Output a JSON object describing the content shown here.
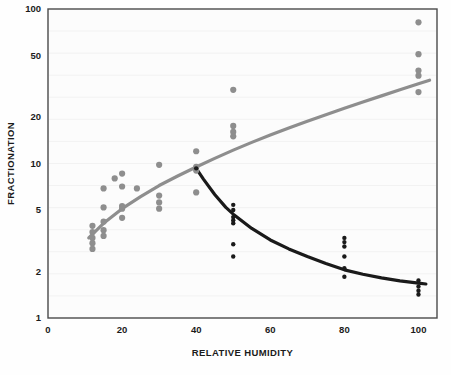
{
  "chart_data": {
    "type": "scatter",
    "title": "",
    "subtitle": "",
    "xlabel": "RELATIVE HUMIDITY",
    "ylabel": "FRACTIONATION",
    "xlim": [
      0,
      105
    ],
    "ylim": [
      1,
      100
    ],
    "yscale": "log",
    "xscale": "linear",
    "grid": false,
    "legend": "none",
    "xticks": [
      0,
      20,
      40,
      60,
      80,
      100
    ],
    "xtick_labels": [
      "0",
      "20",
      "40",
      "60",
      "80",
      "100"
    ],
    "yticks": [
      1,
      2,
      5,
      10,
      20,
      50,
      100
    ],
    "ytick_labels": [
      "1",
      "2",
      "5",
      "10",
      "20",
      "50",
      "100"
    ],
    "colors": {
      "series_gray": "#8e8e8e",
      "series_black": "#1a1a1a",
      "frame": "#4a4a4a",
      "text": "#1b1b1b",
      "background": "#fdfdfd"
    },
    "series": [
      {
        "name": "gray-series",
        "color": "#8e8e8e",
        "marker": "circle",
        "points": [
          {
            "x": 12,
            "y": 3.95
          },
          {
            "x": 12,
            "y": 3.6
          },
          {
            "x": 12,
            "y": 3.3
          },
          {
            "x": 12,
            "y": 3.05
          },
          {
            "x": 12,
            "y": 2.8
          },
          {
            "x": 15,
            "y": 6.9
          },
          {
            "x": 15,
            "y": 5.2
          },
          {
            "x": 15,
            "y": 4.2
          },
          {
            "x": 15,
            "y": 3.7
          },
          {
            "x": 15,
            "y": 3.4
          },
          {
            "x": 18,
            "y": 8.0
          },
          {
            "x": 20,
            "y": 7.1
          },
          {
            "x": 20,
            "y": 5.3
          },
          {
            "x": 20,
            "y": 5.1
          },
          {
            "x": 20,
            "y": 4.45
          },
          {
            "x": 20,
            "y": 8.6
          },
          {
            "x": 24,
            "y": 6.9
          },
          {
            "x": 30,
            "y": 9.8
          },
          {
            "x": 30,
            "y": 6.2
          },
          {
            "x": 30,
            "y": 5.6
          },
          {
            "x": 30,
            "y": 5.1
          },
          {
            "x": 40,
            "y": 12.0
          },
          {
            "x": 40,
            "y": 9.5
          },
          {
            "x": 40,
            "y": 9.0
          },
          {
            "x": 40,
            "y": 6.5
          },
          {
            "x": 50,
            "y": 30.0
          },
          {
            "x": 50,
            "y": 17.5
          },
          {
            "x": 50,
            "y": 16.0
          },
          {
            "x": 50,
            "y": 15.0
          },
          {
            "x": 100,
            "y": 82.0
          },
          {
            "x": 100,
            "y": 51.0
          },
          {
            "x": 100,
            "y": 40.0
          },
          {
            "x": 100,
            "y": 37.0
          },
          {
            "x": 100,
            "y": 29.0
          }
        ]
      },
      {
        "name": "black-series",
        "color": "#1a1a1a",
        "marker": "circle",
        "points": [
          {
            "x": 40,
            "y": 9.3
          },
          {
            "x": 50,
            "y": 5.4
          },
          {
            "x": 50,
            "y": 5.0
          },
          {
            "x": 50,
            "y": 4.5
          },
          {
            "x": 50,
            "y": 4.3
          },
          {
            "x": 50,
            "y": 4.1
          },
          {
            "x": 50,
            "y": 3.0
          },
          {
            "x": 50,
            "y": 2.5
          },
          {
            "x": 80,
            "y": 3.3
          },
          {
            "x": 80,
            "y": 3.1
          },
          {
            "x": 80,
            "y": 2.9
          },
          {
            "x": 80,
            "y": 2.5
          },
          {
            "x": 80,
            "y": 2.1
          },
          {
            "x": 80,
            "y": 1.85
          },
          {
            "x": 100,
            "y": 1.75
          },
          {
            "x": 100,
            "y": 1.6
          },
          {
            "x": 100,
            "y": 1.5
          },
          {
            "x": 100,
            "y": 1.42
          }
        ]
      }
    ],
    "fit_curves": [
      {
        "name": "gray-fit",
        "color": "#8e8e8e",
        "x": [
          11,
          15,
          20,
          25,
          30,
          35,
          40,
          45,
          50,
          55,
          60,
          65,
          70,
          75,
          80,
          85,
          90,
          95,
          100,
          103
        ],
        "y": [
          3.3,
          4.1,
          5.1,
          6.1,
          7.2,
          8.3,
          9.5,
          10.8,
          12.2,
          13.7,
          15.3,
          17.0,
          18.8,
          20.7,
          22.8,
          25.0,
          27.4,
          30.0,
          32.8,
          34.6
        ]
      },
      {
        "name": "black-fit",
        "color": "#1a1a1a",
        "x": [
          40,
          42,
          45,
          48,
          50,
          55,
          60,
          65,
          70,
          75,
          80,
          85,
          90,
          95,
          100,
          102
        ],
        "y": [
          9.3,
          7.9,
          6.3,
          5.2,
          4.7,
          3.8,
          3.2,
          2.8,
          2.5,
          2.25,
          2.05,
          1.92,
          1.82,
          1.74,
          1.68,
          1.66
        ]
      }
    ]
  },
  "plot_geometry": {
    "left": 48,
    "right": 437,
    "top": 9,
    "bottom": 318
  }
}
